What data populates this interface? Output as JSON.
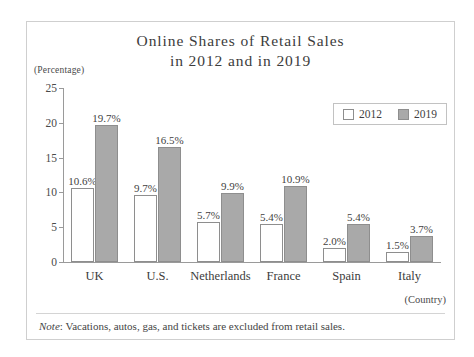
{
  "figure": {
    "title_line1": "Online Shares of Retail Sales",
    "title_line2": "in 2012 and in 2019",
    "unit_label": "(Percentage)",
    "x_axis_title": "(Country)",
    "note_word": "Note",
    "note_separator": ":",
    "note_text": "Vacations, autos, gas, and tickets are excluded from retail sales."
  },
  "legend": {
    "items": [
      {
        "label": "2012",
        "color": "#ffffff"
      },
      {
        "label": "2019",
        "color": "#a9a9a9"
      }
    ]
  },
  "chart_data": {
    "type": "bar",
    "title": "Online Shares of Retail Sales in 2012 and in 2019",
    "xlabel": "(Country)",
    "ylabel": "(Percentage)",
    "ylim": [
      0,
      25
    ],
    "yticks": [
      0,
      5,
      10,
      15,
      20,
      25
    ],
    "ytick_labels": [
      "0",
      "5",
      "10",
      "15",
      "20",
      "25"
    ],
    "grid": false,
    "legend_position": "top-right",
    "categories": [
      "UK",
      "U.S.",
      "Netherlands",
      "France",
      "Spain",
      "Italy"
    ],
    "series": [
      {
        "name": "2012",
        "color": "#ffffff",
        "values": [
          10.6,
          9.7,
          5.7,
          5.4,
          2.0,
          1.5
        ],
        "labels": [
          "10.6%",
          "9.7%",
          "5.7%",
          "5.4%",
          "2.0%",
          "1.5%"
        ]
      },
      {
        "name": "2019",
        "color": "#a9a9a9",
        "values": [
          19.7,
          16.5,
          9.9,
          10.9,
          5.4,
          3.7
        ],
        "labels": [
          "19.7%",
          "16.5%",
          "9.9%",
          "10.9%",
          "5.4%",
          "3.7%"
        ]
      }
    ],
    "note": "Note: Vacations, autos, gas, and tickets are excluded from retail sales."
  }
}
